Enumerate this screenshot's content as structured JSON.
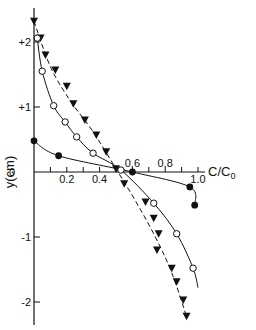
{
  "chart_data": {
    "type": "scatter",
    "title": "",
    "xlabel": "C/C0",
    "ylabel": "y(cm)",
    "xlim": [
      0,
      1.05
    ],
    "ylim": [
      -2.4,
      2.35
    ],
    "grid": false,
    "legend": null,
    "x_ticks": [
      0.2,
      0.4,
      0.6,
      0.8,
      1.0
    ],
    "x_tick_labels": [
      "0.2",
      "0.4",
      "0.6",
      "0.8",
      "1.0"
    ],
    "x_minor_ticks": [
      0.1,
      0.3,
      0.5,
      0.7,
      0.9
    ],
    "y_ticks": [
      2,
      1,
      0,
      -1,
      -2
    ],
    "y_tick_labels": [
      "+2",
      "+1",
      "0",
      "-1",
      "-2"
    ],
    "series": [
      {
        "name": "filled-triangles",
        "marker": "filled-triangle-down",
        "line": "dashed",
        "points": [
          [
            0.0,
            2.32
          ],
          [
            0.04,
            2.06
          ],
          [
            0.07,
            1.8
          ],
          [
            0.13,
            1.57
          ],
          [
            0.2,
            1.32
          ],
          [
            0.24,
            1.05
          ],
          [
            0.31,
            0.8
          ],
          [
            0.38,
            0.57
          ],
          [
            0.44,
            0.31
          ],
          [
            0.5,
            0.05
          ],
          [
            0.55,
            -0.18
          ],
          [
            0.68,
            -0.46
          ],
          [
            0.73,
            -0.71
          ],
          [
            0.76,
            -0.95
          ],
          [
            0.75,
            -1.2
          ],
          [
            0.84,
            -1.48
          ],
          [
            0.87,
            -1.69
          ],
          [
            0.91,
            -1.97
          ],
          [
            0.93,
            -2.22
          ]
        ]
      },
      {
        "name": "open-circles",
        "marker": "open-circle",
        "line": "solid",
        "points": [
          [
            0.02,
            2.06
          ],
          [
            0.05,
            1.55
          ],
          [
            0.12,
            1.02
          ],
          [
            0.19,
            0.77
          ],
          [
            0.26,
            0.54
          ],
          [
            0.36,
            0.29
          ],
          [
            0.53,
            0.03
          ],
          [
            0.73,
            -0.48
          ],
          [
            0.87,
            -0.95
          ],
          [
            0.97,
            -1.48
          ]
        ],
        "curve_end": [
          1.0,
          -1.78
        ]
      },
      {
        "name": "filled-circles",
        "marker": "filled-circle",
        "line": "solid",
        "points": [
          [
            0.0,
            0.48
          ],
          [
            0.15,
            0.25
          ],
          [
            0.6,
            0.0
          ],
          [
            0.95,
            -0.23
          ],
          [
            0.98,
            -0.51
          ]
        ]
      }
    ]
  },
  "labels": {
    "x_axis_title_main": "C/C",
    "x_axis_title_sub": "0",
    "y_axis_title": "y(cm)"
  },
  "colors": {
    "ink": "#111111",
    "background": "#ffffff"
  }
}
